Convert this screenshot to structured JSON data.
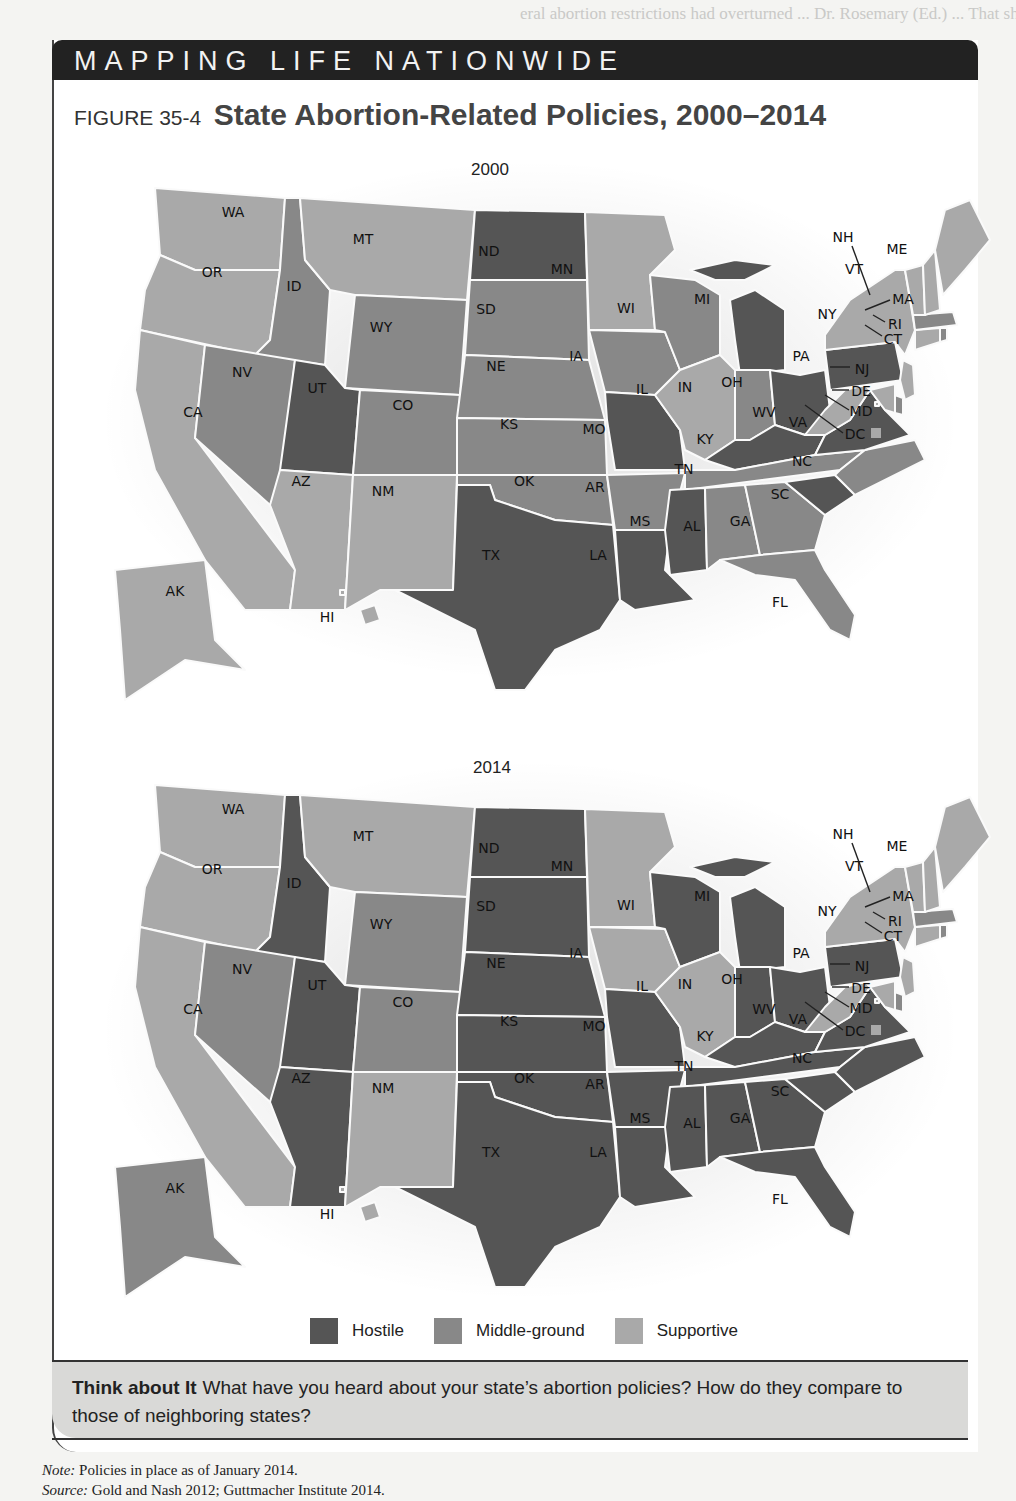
{
  "banner": "MAPPING LIFE NATIONWIDE",
  "figure": {
    "number": "FIGURE 35-4",
    "title": "State Abortion-Related Policies, 2000–2014"
  },
  "colors": {
    "hostile": "#555555",
    "middle": "#888888",
    "supportive": "#a9a9a9"
  },
  "legend": [
    {
      "key": "hostile",
      "label": "Hostile",
      "color": "#555555"
    },
    {
      "key": "middle",
      "label": "Middle-ground",
      "color": "#888888"
    },
    {
      "key": "supportive",
      "label": "Supportive",
      "color": "#a9a9a9"
    }
  ],
  "maps": [
    {
      "year": "2000",
      "policies": {
        "WA": "supportive",
        "OR": "supportive",
        "CA": "supportive",
        "ID": "middle",
        "NV": "middle",
        "MT": "supportive",
        "WY": "middle",
        "UT": "hostile",
        "CO": "middle",
        "AZ": "supportive",
        "NM": "supportive",
        "ND": "hostile",
        "SD": "middle",
        "NE": "middle",
        "KS": "middle",
        "OK": "middle",
        "TX": "hostile",
        "MN": "supportive",
        "IA": "middle",
        "MO": "hostile",
        "AR": "middle",
        "LA": "hostile",
        "WI": "middle",
        "IL": "supportive",
        "MI": "hostile",
        "IN": "middle",
        "OH": "hostile",
        "KY": "hostile",
        "TN": "middle",
        "MS": "hostile",
        "AL": "middle",
        "GA": "middle",
        "FL": "middle",
        "SC": "hostile",
        "NC": "middle",
        "VA": "hostile",
        "WV": "supportive",
        "PA": "hostile",
        "NY": "supportive",
        "NJ": "supportive",
        "DE": "middle",
        "MD": "supportive",
        "DC": "supportive",
        "CT": "supportive",
        "RI": "middle",
        "MA": "middle",
        "VT": "supportive",
        "NH": "supportive",
        "ME": "supportive",
        "AK": "supportive",
        "HI": "supportive"
      }
    },
    {
      "year": "2014",
      "policies": {
        "WA": "supportive",
        "OR": "supportive",
        "CA": "supportive",
        "ID": "hostile",
        "NV": "middle",
        "MT": "supportive",
        "WY": "middle",
        "UT": "hostile",
        "CO": "middle",
        "AZ": "hostile",
        "NM": "supportive",
        "ND": "hostile",
        "SD": "hostile",
        "NE": "hostile",
        "KS": "hostile",
        "OK": "hostile",
        "TX": "hostile",
        "MN": "supportive",
        "IA": "supportive",
        "MO": "hostile",
        "AR": "hostile",
        "LA": "hostile",
        "WI": "hostile",
        "IL": "supportive",
        "MI": "hostile",
        "IN": "hostile",
        "OH": "hostile",
        "KY": "hostile",
        "TN": "hostile",
        "MS": "hostile",
        "AL": "hostile",
        "GA": "hostile",
        "FL": "hostile",
        "SC": "hostile",
        "NC": "hostile",
        "VA": "hostile",
        "WV": "supportive",
        "PA": "hostile",
        "NY": "supportive",
        "NJ": "supportive",
        "DE": "middle",
        "MD": "supportive",
        "DC": "supportive",
        "CT": "supportive",
        "RI": "middle",
        "MA": "middle",
        "VT": "supportive",
        "NH": "supportive",
        "ME": "supportive",
        "AK": "middle",
        "HI": "supportive"
      }
    }
  ],
  "think_about_it": {
    "heading": "Think about It",
    "text": "What have you heard about your state’s abortion policies? How do they compare to those of neighboring states?"
  },
  "note": {
    "label": "Note:",
    "text": "Policies in place as of January 2014."
  },
  "source": {
    "label": "Source:",
    "text": "Gold and Nash 2012; Guttmacher Institute 2014."
  },
  "background_text": "eral abortion restrictions had overturned ... Dr. Rosemary (Ed.) ... That should"
}
